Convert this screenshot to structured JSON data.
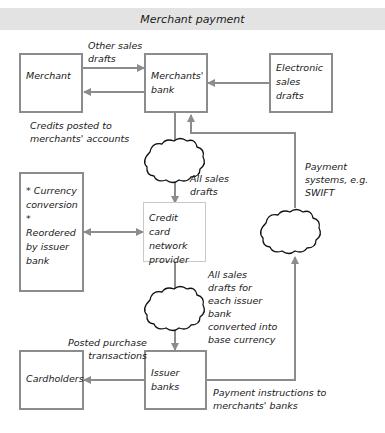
{
  "title": "Merchant payment",
  "nodes": {
    "merchant": "Merchant",
    "merchants_bank": "Merchants'\nbank",
    "electronic_sales_drafts": "Electronic\nsales\ndrafts",
    "currency_box": "* Currency\nconversion\n* Reordered\nby issuer\nbank",
    "credit_card_network": "Credit card\nnetwork\nprovider",
    "cardholders": "Cardholders",
    "issuer_banks": "Issuer\nbanks"
  },
  "edges": {
    "other_sales_drafts": "Other sales\ndrafts",
    "credits_posted": "Credits posted to\nmerchants' accounts",
    "all_sales_drafts": "All sales\ndrafts",
    "payment_systems": "Payment\nsystems, e.g.\nSWIFT",
    "all_sales_drafts_issuer": "All sales\ndrafts for\neach issuer\nbank\nconverted into\nbase currency",
    "posted_purchase": "Posted purchase\ntransactions",
    "payment_instructions": "Payment instructions to\nmerchants' banks"
  },
  "colors": {
    "line": "#8c8c8c",
    "title_bg": "#e3e3e3"
  }
}
